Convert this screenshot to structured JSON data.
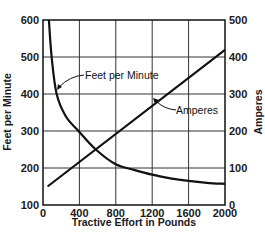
{
  "chart_data": {
    "type": "line",
    "title": "",
    "xlabel": "Tractive Effort in Pounds",
    "ylabel": "Feet per Minute",
    "ylabel_right": "Amperes",
    "xlim": [
      0,
      2000
    ],
    "ylim": [
      100,
      600
    ],
    "ylim_right": [
      0,
      500
    ],
    "x_ticks": [
      0,
      400,
      800,
      1200,
      1600,
      2000
    ],
    "y_ticks": [
      100,
      200,
      300,
      400,
      500,
      600
    ],
    "y_ticks_right": [
      0,
      100,
      200,
      300,
      400,
      500
    ],
    "grid": true,
    "legend": "none (inline annotations)",
    "series": [
      {
        "name": "Feet per Minute",
        "axis": "left",
        "x": [
          65,
          95,
          150,
          250,
          390,
          580,
          800,
          1000,
          1200,
          1400,
          1600,
          1800,
          2000
        ],
        "values": [
          600,
          500,
          400,
          340,
          300,
          250,
          210,
          195,
          182,
          172,
          165,
          160,
          157
        ]
      },
      {
        "name": "Amperes",
        "axis": "right",
        "x": [
          50,
          2000
        ],
        "values": [
          50,
          419
        ]
      }
    ],
    "annotations": [
      {
        "text": "Feet per Minute",
        "points_to": "Feet per Minute curve"
      },
      {
        "text": "Amperes",
        "points_to": "Amperes line"
      }
    ]
  },
  "labels": {
    "annot_fpm": "Feet per Minute",
    "annot_amps": "Amperes",
    "xlabel": "Tractive Effort in Pounds",
    "ylabel_left": "Feet per Minute",
    "ylabel_right": "Amperes"
  },
  "colors": {
    "line": "#111111",
    "grid": "#333333",
    "background": "#ffffff"
  }
}
